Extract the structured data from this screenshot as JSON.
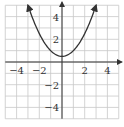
{
  "chart_data": {
    "type": "line",
    "title": "",
    "xlabel": "",
    "ylabel": "",
    "xlim": [
      -5,
      5
    ],
    "ylim": [
      -5,
      5
    ],
    "grid": true,
    "x_ticks": [
      -4,
      -2,
      2,
      4
    ],
    "y_ticks": [
      4,
      2,
      -2,
      -4
    ],
    "x_tick_labels": [
      "−4",
      "−2",
      "2",
      "4"
    ],
    "y_tick_labels": [
      "4",
      "2",
      "−2",
      "−4"
    ],
    "series": [
      {
        "name": "parabola",
        "equation": "y = 0.5x^2 + 0.5",
        "x": [
          -3.0,
          -2.5,
          -2.0,
          -1.5,
          -1.0,
          -0.5,
          0.0,
          0.5,
          1.0,
          1.5,
          2.0,
          2.5,
          3.0
        ],
        "y": [
          5.0,
          3.625,
          2.5,
          1.625,
          1.0,
          0.625,
          0.5,
          0.625,
          1.0,
          1.625,
          2.5,
          3.625,
          5.0
        ],
        "arrows_at_ends": true
      }
    ],
    "colors": {
      "grid": "#c8c8c8",
      "axis": "#333333",
      "curve": "#333333"
    }
  }
}
